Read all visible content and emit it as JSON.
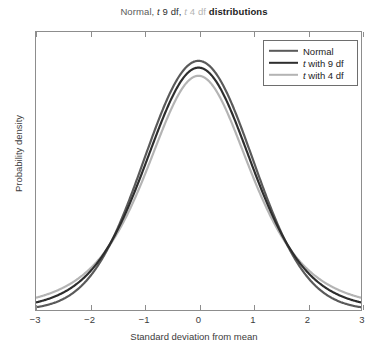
{
  "chart_data": {
    "type": "line",
    "title": "Normal, t 9 df, t 4 df distributions",
    "title_segments": [
      {
        "text": "Normal, ",
        "color": "#5a5a5a",
        "style": "normal"
      },
      {
        "text": "t 9 df, ",
        "color": "#2e2e2e",
        "style": "italic-lead"
      },
      {
        "text": "t 4 df ",
        "color": "#b4b4b4",
        "style": "italic-lead"
      },
      {
        "text": "distributions",
        "color": "#1d1d1d",
        "style": "bold"
      }
    ],
    "xlabel": "Standard deviation from mean",
    "ylabel": "Probability density",
    "xlim": [
      -3,
      3
    ],
    "ylim": [
      0,
      0.4451
    ],
    "xticks": [
      "-3",
      "-2",
      "-1",
      "0",
      "1",
      "2",
      "3"
    ],
    "xtick_values": [
      -3,
      -2,
      -1,
      0,
      1,
      2,
      3
    ],
    "yticks": [],
    "grid": false,
    "legend_position": "upper right",
    "series": [
      {
        "name": "Normal",
        "color": "#5a5a5a",
        "peak": 0.3989,
        "x": [
          -3,
          -2.75,
          -2.5,
          -2.25,
          -2,
          -1.75,
          -1.5,
          -1.25,
          -1,
          -0.75,
          -0.5,
          -0.25,
          0,
          0.25,
          0.5,
          0.75,
          1,
          1.25,
          1.5,
          1.75,
          2,
          2.25,
          2.5,
          2.75,
          3
        ],
        "values": [
          0.0044,
          0.0091,
          0.0175,
          0.0317,
          0.054,
          0.0863,
          0.1295,
          0.1826,
          0.242,
          0.3011,
          0.3521,
          0.3867,
          0.3989,
          0.3867,
          0.3521,
          0.3011,
          0.242,
          0.1826,
          0.1295,
          0.0863,
          0.054,
          0.0317,
          0.0175,
          0.0091,
          0.0044
        ]
      },
      {
        "name": "t with 9 df",
        "color": "#2e2e2e",
        "peak": 0.388,
        "x": [
          -3,
          -2.75,
          -2.5,
          -2.25,
          -2,
          -1.75,
          -1.5,
          -1.25,
          -1,
          -0.75,
          -0.5,
          -0.25,
          0,
          0.25,
          0.5,
          0.75,
          1,
          1.25,
          1.5,
          1.75,
          2,
          2.25,
          2.5,
          2.75,
          3
        ],
        "values": [
          0.0098,
          0.0156,
          0.0249,
          0.0392,
          0.0611,
          0.0925,
          0.1353,
          0.1888,
          0.2491,
          0.3083,
          0.3563,
          0.3853,
          0.388,
          0.3853,
          0.3563,
          0.3083,
          0.2491,
          0.1888,
          0.1353,
          0.0925,
          0.0611,
          0.0392,
          0.0249,
          0.0156,
          0.0098
        ]
      },
      {
        "name": "t with 4 df",
        "color": "#b4b4b4",
        "peak": 0.375,
        "x": [
          -3,
          -2.75,
          -2.5,
          -2.25,
          -2,
          -1.75,
          -1.5,
          -1.25,
          -1,
          -0.75,
          -0.5,
          -0.25,
          0,
          0.25,
          0.5,
          0.75,
          1,
          1.25,
          1.5,
          1.75,
          2,
          2.25,
          2.5,
          2.75,
          3
        ],
        "values": [
          0.0092,
          0.0145,
          0.0231,
          0.0372,
          0.0602,
          0.0954,
          0.1429,
          0.1968,
          0.2547,
          0.3061,
          0.3458,
          0.3687,
          0.375,
          0.3687,
          0.3458,
          0.3061,
          0.2547,
          0.1968,
          0.1429,
          0.0954,
          0.0602,
          0.0372,
          0.0231,
          0.0145,
          0.0092
        ]
      }
    ]
  },
  "legend": {
    "items": [
      {
        "label": "Normal",
        "italic_lead": "",
        "color": "#5a5a5a"
      },
      {
        "label": " with 9 df",
        "italic_lead": "t",
        "color": "#2e2e2e"
      },
      {
        "label": " with 4 df",
        "italic_lead": "t",
        "color": "#b4b4b4"
      }
    ]
  }
}
